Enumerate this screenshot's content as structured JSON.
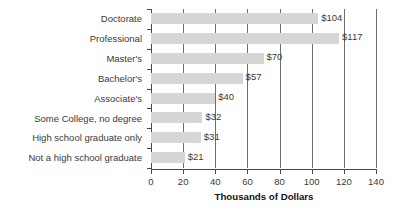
{
  "chart_data": {
    "type": "bar",
    "orientation": "horizontal",
    "title": "",
    "xlabel": "Thousands of Dollars",
    "ylabel": "",
    "categories": [
      "Doctorate",
      "Professional",
      "Master's",
      "Bachelor's",
      "Associate's",
      "Some College, no degree",
      "High school graduate only",
      "Not a high school graduate"
    ],
    "values": [
      104,
      117,
      70,
      57,
      40,
      32,
      31,
      21
    ],
    "value_labels": [
      "$104",
      "$117",
      "$70",
      "$57",
      "$40",
      "$32",
      "$31",
      "$21"
    ],
    "xlim": [
      0,
      140
    ],
    "xticks": [
      0,
      20,
      40,
      60,
      80,
      100,
      120,
      140
    ],
    "xtick_labels": [
      "0",
      "20",
      "40",
      "60",
      "80",
      "100",
      "120",
      "140"
    ],
    "grid": "vertical",
    "legend": "none",
    "bar_color": "#d6d6d6",
    "gridline_color": "#6e6e6e",
    "axis_color": "#4a4a4a",
    "text_color": "#3a3a3a"
  }
}
